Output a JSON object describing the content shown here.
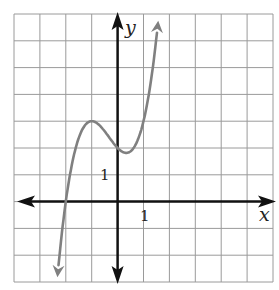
{
  "chart_data": {
    "type": "line",
    "title": "",
    "xlabel": "x",
    "ylabel": "y",
    "xlim": [
      -4,
      6
    ],
    "ylim": [
      -3,
      7
    ],
    "grid": true,
    "grid_step": 1,
    "tick_labels": {
      "x": "1",
      "y": "1"
    },
    "series": [
      {
        "name": "f(x) = x^3 + x^2 - x + 2",
        "color": "#808080",
        "x": [
          -2.4,
          -2.0,
          -1.5,
          -1.0,
          -0.5,
          0.0,
          0.333,
          0.5,
          1.0,
          1.5
        ],
        "y": [
          -2.66,
          0.0,
          2.38,
          3.0,
          2.63,
          2.0,
          1.81,
          1.88,
          3.0,
          6.13
        ],
        "arrows_both_ends": true,
        "local_max": [
          -1,
          3
        ],
        "local_min": [
          0.333,
          1.81
        ],
        "x_intercept": -2,
        "y_intercept": 2
      }
    ]
  },
  "labels": {
    "x_axis": "x",
    "y_axis": "y",
    "x_tick": "1",
    "y_tick": "1"
  },
  "colors": {
    "grid": "#9a9a9a",
    "axes": "#111111",
    "curve": "#808080"
  }
}
